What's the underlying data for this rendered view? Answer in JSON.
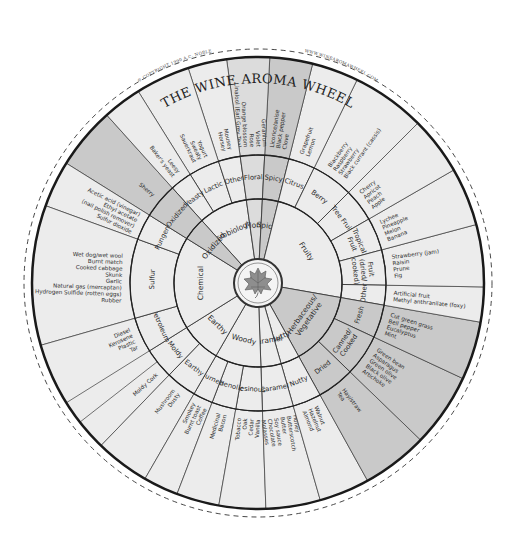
{
  "title": "THE WINE AROMA WHEEL",
  "copyright": "© COPYRIGHT 1990 A.C. NOBLE",
  "website": "WWW.WINEAROMAWHEEL.COM",
  "colors": {
    "background": "#ffffff",
    "light": "#ececec",
    "medium": "#dcdcdc",
    "dark": "#c9c9c9",
    "line": "#2a2a2a",
    "hub": "#f4f4f4",
    "leaf": "#8e8e8e"
  },
  "geometry": {
    "cx": 258,
    "cy": 283,
    "r_hub": 24,
    "r_inner": 84,
    "r_middle": 128,
    "r_outer": 226,
    "r_dashed": 234
  },
  "wheel": {
    "tier1": [
      {
        "label": "Microbiological",
        "start": -42,
        "end": -8
      },
      {
        "label": "Floral",
        "start": -8,
        "end": 3
      },
      {
        "label": "Spicy",
        "start": 3,
        "end": 14
      },
      {
        "label": "Fruity",
        "start": 14,
        "end": 100
      },
      {
        "label": "Herbaceous/ Vegetative",
        "start": 100,
        "end": 151
      },
      {
        "label": "Nutty",
        "start": 151,
        "end": 164
      },
      {
        "label": "Caramel",
        "start": 164,
        "end": 178
      },
      {
        "label": "Woody",
        "start": 178,
        "end": 210
      },
      {
        "label": "Earthy",
        "start": 210,
        "end": 238
      },
      {
        "label": "Chemical",
        "start": 238,
        "end": 302
      },
      {
        "label": "Oxidized",
        "start": 302,
        "end": 318
      }
    ],
    "tier2": [
      {
        "label": "Lactic",
        "start": -32,
        "end": -18
      },
      {
        "label": "Other",
        "start": -18,
        "end": -8
      },
      {
        "label": "Yeasty",
        "start": -42,
        "end": -32
      },
      {
        "label": "Floral",
        "start": -8,
        "end": 3
      },
      {
        "label": "Spicy",
        "start": 3,
        "end": 14
      },
      {
        "label": "Citrus",
        "start": 14,
        "end": 26
      },
      {
        "label": "Berry",
        "start": 26,
        "end": 45
      },
      {
        "label": "Tree Fruit",
        "start": 45,
        "end": 60
      },
      {
        "label": "Tropical Fruit",
        "start": 60,
        "end": 75
      },
      {
        "label": "Fruit (dried/ cooked)",
        "start": 75,
        "end": 91
      },
      {
        "label": "Other",
        "start": 91,
        "end": 100
      },
      {
        "label": "Fresh",
        "start": 100,
        "end": 115
      },
      {
        "label": "Canned/ Cooked",
        "start": 115,
        "end": 134
      },
      {
        "label": "Dried",
        "start": 134,
        "end": 151
      },
      {
        "label": "Nutty",
        "start": 151,
        "end": 164
      },
      {
        "label": "Caramel",
        "start": 164,
        "end": 178
      },
      {
        "label": "Resinous",
        "start": 178,
        "end": 190
      },
      {
        "label": "Phenolic",
        "start": 190,
        "end": 201
      },
      {
        "label": "Burned",
        "start": 201,
        "end": 210
      },
      {
        "label": "Earthy",
        "start": 210,
        "end": 224
      },
      {
        "label": "Moldy",
        "start": 224,
        "end": 238
      },
      {
        "label": "Petroleum",
        "start": 238,
        "end": 254
      },
      {
        "label": "Sulfur",
        "start": 254,
        "end": 290
      },
      {
        "label": "Pungent",
        "start": 290,
        "end": 302
      },
      {
        "label": "Oxidized",
        "start": 302,
        "end": 318
      }
    ],
    "tier3": [
      {
        "lines": [
          "Sherry"
        ],
        "start": 302,
        "end": 318
      },
      {
        "lines": [
          "Acetic acid (vinegar)",
          "Ethyl acetate",
          "(nail polish remover)",
          "Sulfur dioxide"
        ],
        "start": 290,
        "end": 302
      },
      {
        "lines": [
          "Wet dog/wet wool",
          "Burnt match",
          "Cooked cabbage",
          "Skunk",
          "Garlic",
          "Natural gas (mercaptan)",
          "Hydrogen Sulfide (rotten eggs)",
          "Rubber"
        ],
        "start": 254,
        "end": 290
      },
      {
        "lines": [
          "Diesel",
          "Kerosene",
          "Plastic",
          "Tar"
        ],
        "start": 238,
        "end": 254
      },
      {
        "lines": [
          "Moldy Cork"
        ],
        "start": 224,
        "end": 232
      },
      {
        "lines": [
          "Mushroom",
          "Dusty"
        ],
        "start": 210,
        "end": 224
      },
      {
        "lines": [
          "Smokey",
          "Burnt toast",
          "Coffee"
        ],
        "start": 201,
        "end": 210
      },
      {
        "lines": [
          "Medicinal",
          "Bacon"
        ],
        "start": 190,
        "end": 201
      },
      {
        "lines": [
          "Tobacco",
          "Oak",
          "Cedar",
          "Vanilla"
        ],
        "start": 178,
        "end": 190
      },
      {
        "lines": [
          "Honey",
          "Butterscotch",
          "Butter",
          "Soy sauce",
          "Chocolate",
          "Molasses"
        ],
        "start": 164,
        "end": 178
      },
      {
        "lines": [
          "Walnut",
          "Hazelnut",
          "Almond"
        ],
        "start": 151,
        "end": 164
      },
      {
        "lines": [
          "Hay/straw",
          "Tea"
        ],
        "start": 134,
        "end": 151
      },
      {
        "lines": [
          "Green bean",
          "Asparagus",
          "Green olive",
          "Black olive",
          "Artichoke"
        ],
        "start": 115,
        "end": 134
      },
      {
        "lines": [
          "Cut green grass",
          "Bell pepper",
          "Eucalyptus",
          "Mint"
        ],
        "start": 100,
        "end": 115
      },
      {
        "lines": [
          "Artificial fruit",
          "Methyl anthranilate (foxy)"
        ],
        "start": 91,
        "end": 100
      },
      {
        "lines": [
          "Strawberry (jam)",
          "Raisin",
          "Prune",
          "Fig"
        ],
        "start": 75,
        "end": 91
      },
      {
        "lines": [
          "Lychee",
          "Pineapple",
          "Melon",
          "Banana"
        ],
        "start": 60,
        "end": 75
      },
      {
        "lines": [
          "Cherry",
          "Apricot",
          "Peach",
          "Apple"
        ],
        "start": 45,
        "end": 60
      },
      {
        "lines": [
          "Blackberry",
          "Raspberry",
          "Strawberry",
          "Black currant (cassis)"
        ],
        "start": 26,
        "end": 45
      },
      {
        "lines": [
          "Grapefruit",
          "Lemon"
        ],
        "start": 14,
        "end": 26
      },
      {
        "lines": [
          "Licorice/anise",
          "Black pepper",
          "Clove"
        ],
        "start": 3,
        "end": 14
      },
      {
        "lines": [
          "Geranium",
          "Violet",
          "Rose",
          "Orange blossom",
          "Linalool (Earl Grey Tea)"
        ],
        "start": -8,
        "end": 3
      },
      {
        "lines": [
          "Mousey",
          "Horsey"
        ],
        "start": -18,
        "end": -8
      },
      {
        "lines": [
          "Yogurt",
          "Sweaty",
          "Sauerkraut"
        ],
        "start": -32,
        "end": -18
      },
      {
        "lines": [
          "Leesy",
          "Baker's yeast"
        ],
        "start": -42,
        "end": -32
      }
    ],
    "shading": {
      "Microbiological": "light",
      "Floral": "medium",
      "Spicy": "dark",
      "Fruity": "light",
      "Herbaceous/ Vegetative": "dark",
      "Nutty": "light",
      "Caramel": "light",
      "Woody": "light",
      "Earthy": "light",
      "Chemical": "light",
      "Oxidized": "dark"
    }
  }
}
